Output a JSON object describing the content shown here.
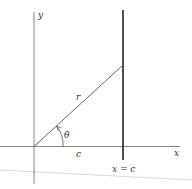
{
  "diagram": {
    "labels": {
      "y_axis": "y",
      "x_axis": "x",
      "ray": "r",
      "angle": "θ",
      "x_segment": "c",
      "vertical_line": "x = c"
    },
    "colors": {
      "axis": "#555555",
      "ray": "#555555",
      "vertical_line": "#222222",
      "edge_artifact": "#d8d8d8"
    }
  }
}
